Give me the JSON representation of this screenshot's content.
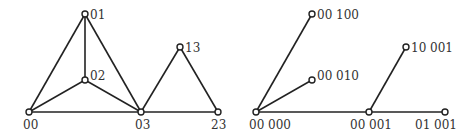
{
  "diagrams": [
    {
      "name": "left-graph",
      "nodes": [
        {
          "id": "00",
          "label": "00",
          "x": 29,
          "y": 112,
          "lx": 23,
          "ly": 129
        },
        {
          "id": "01",
          "label": "01",
          "x": 85,
          "y": 14,
          "lx": 90,
          "ly": 19
        },
        {
          "id": "02",
          "label": "02",
          "x": 85,
          "y": 80,
          "lx": 90,
          "ly": 80
        },
        {
          "id": "03",
          "label": "03",
          "x": 141,
          "y": 112,
          "lx": 135,
          "ly": 129
        },
        {
          "id": "13",
          "label": "13",
          "x": 180,
          "y": 47,
          "lx": 185,
          "ly": 52
        },
        {
          "id": "23",
          "label": "23",
          "x": 218,
          "y": 112,
          "lx": 211,
          "ly": 129
        }
      ],
      "edges": [
        [
          "00",
          "01"
        ],
        [
          "01",
          "02"
        ],
        [
          "01",
          "03"
        ],
        [
          "00",
          "02"
        ],
        [
          "02",
          "03"
        ],
        [
          "00",
          "03"
        ],
        [
          "03",
          "13"
        ],
        [
          "13",
          "23"
        ],
        [
          "03",
          "23"
        ]
      ]
    },
    {
      "name": "right-tree",
      "nodes": [
        {
          "id": "00000",
          "label": "00 000",
          "x": 256,
          "y": 112,
          "lx": 249,
          "ly": 129
        },
        {
          "id": "00100",
          "label": "00 100",
          "x": 312,
          "y": 14,
          "lx": 317,
          "ly": 19
        },
        {
          "id": "00010",
          "label": "00 010",
          "x": 312,
          "y": 80,
          "lx": 317,
          "ly": 80
        },
        {
          "id": "00001",
          "label": "00 001",
          "x": 369,
          "y": 112,
          "lx": 350,
          "ly": 129
        },
        {
          "id": "10001",
          "label": "10 001",
          "x": 406,
          "y": 47,
          "lx": 411,
          "ly": 52
        },
        {
          "id": "01001",
          "label": "01 001",
          "x": 445,
          "y": 112,
          "lx": 415,
          "ly": 129
        }
      ],
      "edges": [
        [
          "00000",
          "00100"
        ],
        [
          "00000",
          "00010"
        ],
        [
          "00000",
          "00001"
        ],
        [
          "00001",
          "10001"
        ],
        [
          "00001",
          "01001"
        ]
      ]
    }
  ]
}
